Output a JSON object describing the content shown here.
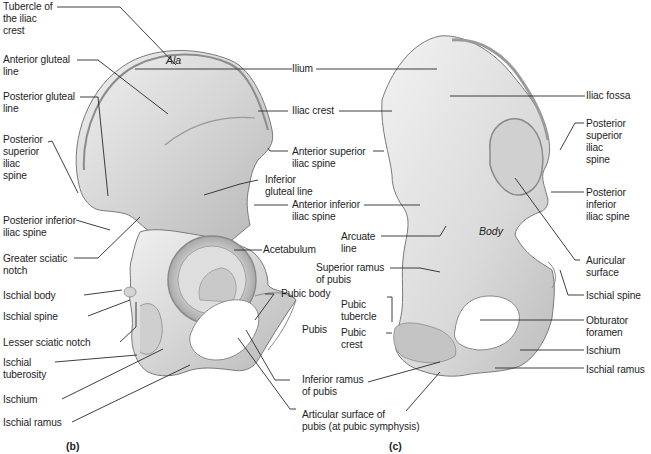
{
  "figure": {
    "panels": [
      {
        "id": "b",
        "caption": "(b)",
        "view": "lateral"
      },
      {
        "id": "c",
        "caption": "(c)",
        "view": "medial"
      }
    ]
  },
  "panel_b": {
    "caption": "(b)",
    "region_label": "Ala",
    "labels": {
      "tubercle_iliac_crest": "Tubercle of\nthe iliac\ncrest",
      "anterior_gluteal_line": "Anterior gluteal\nline",
      "posterior_gluteal_line": "Posterior gluteal\nline",
      "posterior_superior_iliac_spine": "Posterior\nsuperior\niliac\nspine",
      "posterior_inferior_iliac_spine": "Posterior inferior\niliac spine",
      "greater_sciatic_notch": "Greater sciatic\nnotch",
      "ischial_body": "Ischial body",
      "ischial_spine": "Ischial spine",
      "lesser_sciatic_notch": "Lesser sciatic notch",
      "ischial_tuberosity": "Ischial\ntuberosity",
      "ischium": "Ischium",
      "ischial_ramus": "Ischial ramus",
      "inferior_gluteal_line": "Inferior\ngluteal line",
      "acetabulum": "Acetabulum",
      "pubic_body": "Pubic body",
      "pubis": "Pubis"
    }
  },
  "shared_labels": {
    "ilium": "Ilium",
    "iliac_crest": "Iliac crest",
    "anterior_superior_iliac_spine": "Anterior superior\niliac spine",
    "anterior_inferior_iliac_spine": "Anterior inferior\niliac spine",
    "inferior_ramus_of_pubis": "Inferior ramus\nof pubis",
    "articular_surface": "Articular surface of\npubis (at pubic symphysis)"
  },
  "panel_c": {
    "caption": "(c)",
    "region_label": "Body",
    "labels": {
      "arcuate_line": "Arcuate\nline",
      "superior_ramus_of_pubis": "Superior ramus\nof pubis",
      "pubic_tubercle": "Pubic\ntubercle",
      "pubic_crest": "Pubic\ncrest",
      "iliac_fossa": "Iliac fossa",
      "posterior_superior_iliac_spine": "Posterior\nsuperior\niliac\nspine",
      "posterior_inferior_iliac_spine": "Posterior\ninferior\niliac spine",
      "auricular_surface": "Auricular\nsurface",
      "ischial_spine": "Ischial spine",
      "obturator_foramen": "Obturator\nforamen",
      "ischium": "Ischium",
      "ischial_ramus": "Ischial ramus"
    }
  },
  "colors": {
    "background": "#ffffff",
    "bone_fill": "#d9d9d9",
    "bone_light": "#ececec",
    "bone_shadow": "#9a9a9a",
    "leader_line": "#2a2a2a",
    "text": "#1e1e1e"
  }
}
